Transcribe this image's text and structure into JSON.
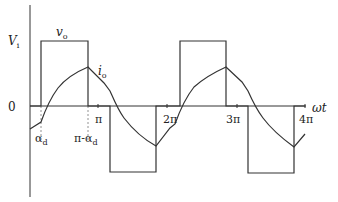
{
  "diagram": {
    "colors": {
      "line": "#333333",
      "background": "#ffffff",
      "dashed": "#777777"
    },
    "axes": {
      "x_label": "ωt",
      "zero_label": "0",
      "y_level_label_main": "V",
      "y_level_label_sub": "i"
    },
    "ticks": [
      {
        "label": "π",
        "x": 98
      },
      {
        "label": "2π",
        "x": 167
      },
      {
        "label": "3π",
        "x": 237
      },
      {
        "label": "4π",
        "x": 305
      }
    ],
    "annotations": {
      "alpha_main": "α",
      "alpha_sub": "d",
      "pi_minus_alpha_main": "π-α",
      "pi_minus_alpha_sub": "d",
      "vo_main": "v",
      "vo_sub": "o",
      "io_main": "i",
      "io_sub": "o"
    },
    "waveforms": {
      "v_o": "square wave: +Vi on [α_d, π-α_d], 0 otherwise; -Vi on [π+α_d, 2π-α_d]; repeats",
      "i_o": "piecewise exponential current lagging voltage"
    }
  }
}
